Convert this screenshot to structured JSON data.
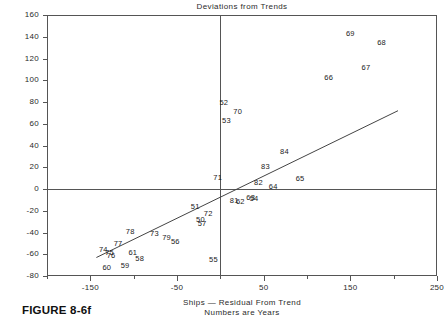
{
  "figure": {
    "caption": "FIGURE 8-6f"
  },
  "chart_data": {
    "type": "scatter",
    "title": "Deviations from Trends",
    "xlabel_line1": "Ships — Residual From Trend",
    "xlabel_line2": "Numbers are Years",
    "ylabel": "",
    "xlim": [
      -200,
      250
    ],
    "ylim": [
      -80,
      160
    ],
    "grid": false,
    "legend": "none",
    "marker_style": "text-labels-are-years",
    "xticks": [
      -150,
      -50,
      50,
      150,
      250
    ],
    "xtick_labels": [
      "-150",
      "-50",
      "50",
      "150",
      "250"
    ],
    "x_minor_ticks": [
      -200,
      -100,
      0,
      100,
      200
    ],
    "yticks": [
      -80,
      -60,
      -40,
      -20,
      0,
      20,
      40,
      60,
      80,
      100,
      120,
      140,
      160
    ],
    "ytick_labels": [
      "-80",
      "-60",
      "-40",
      "-20",
      "0",
      "20",
      "40",
      "60",
      "80",
      "100",
      "120",
      "140",
      "160"
    ],
    "reference_lines": [
      {
        "orientation": "vertical",
        "value": 0
      },
      {
        "orientation": "horizontal",
        "value": 0
      }
    ],
    "trend_line": {
      "x": [
        -143,
        205
      ],
      "y": [
        -63,
        72
      ]
    },
    "points": [
      {
        "label": "69",
        "x": 150,
        "y": 143
      },
      {
        "label": "68",
        "x": 186,
        "y": 135
      },
      {
        "label": "67",
        "x": 168,
        "y": 112
      },
      {
        "label": "66",
        "x": 125,
        "y": 103
      },
      {
        "label": "52",
        "x": 4,
        "y": 80
      },
      {
        "label": "70",
        "x": 20,
        "y": 72
      },
      {
        "label": "53",
        "x": 7,
        "y": 63
      },
      {
        "label": "84",
        "x": 74,
        "y": 35
      },
      {
        "label": "83",
        "x": 52,
        "y": 21
      },
      {
        "label": "65",
        "x": 92,
        "y": 10
      },
      {
        "label": "82",
        "x": 44,
        "y": 6
      },
      {
        "label": "64",
        "x": 61,
        "y": 3
      },
      {
        "label": "71",
        "x": -3,
        "y": 11
      },
      {
        "label": "81",
        "x": 16,
        "y": -10
      },
      {
        "label": "62",
        "x": 23,
        "y": -11
      },
      {
        "label": "63",
        "x": 35,
        "y": -7
      },
      {
        "label": "54",
        "x": 39,
        "y": -8
      },
      {
        "label": "51",
        "x": -29,
        "y": -16
      },
      {
        "label": "72",
        "x": -14,
        "y": -22
      },
      {
        "label": "50",
        "x": -23,
        "y": -28
      },
      {
        "label": "57",
        "x": -21,
        "y": -31
      },
      {
        "label": "78",
        "x": -104,
        "y": -39
      },
      {
        "label": "73",
        "x": -76,
        "y": -40
      },
      {
        "label": "79",
        "x": -62,
        "y": -44
      },
      {
        "label": "56",
        "x": -52,
        "y": -48
      },
      {
        "label": "77",
        "x": -118,
        "y": -50
      },
      {
        "label": "74",
        "x": -135,
        "y": -55
      },
      {
        "label": "75",
        "x": -128,
        "y": -58
      },
      {
        "label": "76",
        "x": -126,
        "y": -61
      },
      {
        "label": "61",
        "x": -101,
        "y": -58
      },
      {
        "label": "58",
        "x": -93,
        "y": -63
      },
      {
        "label": "55",
        "x": -8,
        "y": -64
      },
      {
        "label": "59",
        "x": -110,
        "y": -70
      },
      {
        "label": "60",
        "x": -131,
        "y": -72
      }
    ]
  }
}
